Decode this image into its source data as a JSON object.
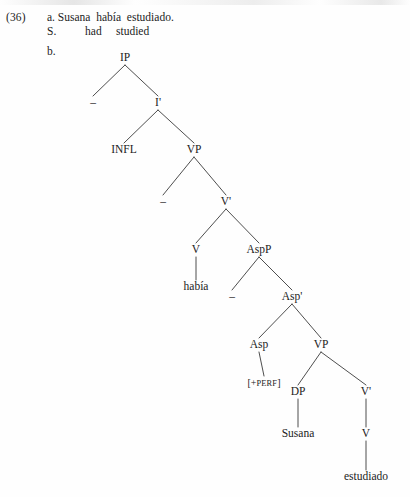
{
  "example": {
    "number": "(36)",
    "item_a_marker": "a.",
    "item_b_marker": "b.",
    "sentence": "Susana  había  estudiado.",
    "gloss": "S.          had     studied"
  },
  "tree": {
    "nodes": [
      {
        "id": "ip",
        "label": "IP",
        "x": 125,
        "y": 58,
        "kind": "category"
      },
      {
        "id": "trace1",
        "label": "–",
        "x": 93,
        "y": 103,
        "kind": "trace"
      },
      {
        "id": "ibar",
        "label": "I'",
        "x": 158,
        "y": 103,
        "kind": "category"
      },
      {
        "id": "infl",
        "label": "INFL",
        "x": 124,
        "y": 150,
        "kind": "category"
      },
      {
        "id": "vp1",
        "label": "VP",
        "x": 194,
        "y": 150,
        "kind": "category"
      },
      {
        "id": "trace2",
        "label": "–",
        "x": 163,
        "y": 202,
        "kind": "trace"
      },
      {
        "id": "vbar1",
        "label": "V'",
        "x": 226,
        "y": 202,
        "kind": "category"
      },
      {
        "id": "v1",
        "label": "V",
        "x": 196,
        "y": 250,
        "kind": "category"
      },
      {
        "id": "aspp",
        "label": "AspP",
        "x": 259,
        "y": 250,
        "kind": "category"
      },
      {
        "id": "habia",
        "label": "había",
        "x": 196,
        "y": 287,
        "kind": "lexical"
      },
      {
        "id": "trace3",
        "label": "–",
        "x": 232,
        "y": 297,
        "kind": "trace"
      },
      {
        "id": "aspbar",
        "label": "Asp'",
        "x": 292,
        "y": 297,
        "kind": "category"
      },
      {
        "id": "asp",
        "label": "Asp",
        "x": 259,
        "y": 345,
        "kind": "category"
      },
      {
        "id": "vp2",
        "label": "VP",
        "x": 321,
        "y": 345,
        "kind": "category"
      },
      {
        "id": "perf",
        "label": "[+PERF]",
        "x": 264,
        "y": 383,
        "kind": "feature"
      },
      {
        "id": "dp",
        "label": "DP",
        "x": 298,
        "y": 392,
        "kind": "category"
      },
      {
        "id": "vbar2",
        "label": "V'",
        "x": 366,
        "y": 392,
        "kind": "category"
      },
      {
        "id": "susana",
        "label": "Susana",
        "x": 298,
        "y": 434,
        "kind": "lexical"
      },
      {
        "id": "v2",
        "label": "V",
        "x": 366,
        "y": 434,
        "kind": "category"
      },
      {
        "id": "estudiado",
        "label": "estudiado",
        "x": 366,
        "y": 477,
        "kind": "lexical"
      }
    ],
    "edges": [
      {
        "from": "ip",
        "to": "trace1"
      },
      {
        "from": "ip",
        "to": "ibar"
      },
      {
        "from": "ibar",
        "to": "infl"
      },
      {
        "from": "ibar",
        "to": "vp1"
      },
      {
        "from": "vp1",
        "to": "trace2"
      },
      {
        "from": "vp1",
        "to": "vbar1"
      },
      {
        "from": "vbar1",
        "to": "v1"
      },
      {
        "from": "vbar1",
        "to": "aspp"
      },
      {
        "from": "v1",
        "to": "habia"
      },
      {
        "from": "aspp",
        "to": "trace3"
      },
      {
        "from": "aspp",
        "to": "aspbar"
      },
      {
        "from": "aspbar",
        "to": "asp"
      },
      {
        "from": "aspbar",
        "to": "vp2"
      },
      {
        "from": "asp",
        "to": "perf"
      },
      {
        "from": "vp2",
        "to": "dp"
      },
      {
        "from": "vp2",
        "to": "vbar2"
      },
      {
        "from": "dp",
        "to": "susana"
      },
      {
        "from": "vbar2",
        "to": "v2"
      },
      {
        "from": "v2",
        "to": "estudiado"
      }
    ],
    "line_color": "#3a3a3a"
  }
}
